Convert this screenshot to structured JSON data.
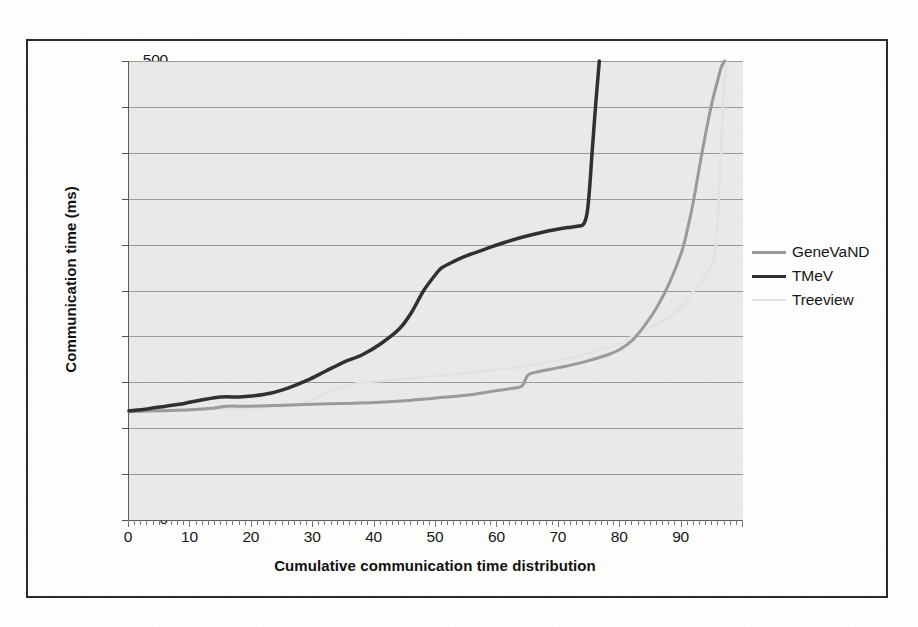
{
  "figure": {
    "background_color": "#fdfdfc",
    "frame_color": "#2b2b2b",
    "plot_background_color": "#e9e9e9",
    "gridline_color": "#9a9a9a"
  },
  "legend": {
    "position": "right",
    "entries": [
      {
        "label": "GeneVaND",
        "color": "#9a9a9a",
        "width": 3
      },
      {
        "label": "TMeV",
        "color": "#303030",
        "width": 3.5
      },
      {
        "label": "Treeview",
        "color": "#e2e2e2",
        "width": 2.5
      }
    ]
  },
  "chart_data": {
    "type": "line",
    "title": "",
    "subtitle": "",
    "xlabel": "Cumulative communication time distribution",
    "ylabel": "Communication time (ms)",
    "xlim": [
      0,
      100
    ],
    "ylim": [
      0,
      500
    ],
    "grid": true,
    "legend_position": "right",
    "xticks": [
      0,
      10,
      20,
      30,
      40,
      50,
      60,
      70,
      80,
      90
    ],
    "yticks": [
      0,
      50,
      100,
      150,
      200,
      250,
      300,
      350,
      400,
      450,
      500
    ],
    "x_minor_tick_step": 1,
    "series": [
      {
        "name": "GeneVaND",
        "color": "#9a9a9a",
        "width": 3,
        "x": [
          0,
          5,
          10,
          14,
          16,
          20,
          25,
          30,
          35,
          40,
          45,
          50,
          55,
          58,
          60,
          62,
          64,
          65,
          67,
          70,
          74,
          78,
          80,
          82,
          84,
          86,
          88,
          90,
          91,
          92,
          93,
          94,
          95,
          96,
          96.5,
          97
        ],
        "y": [
          118,
          119,
          120,
          122,
          124,
          124,
          125,
          126,
          127,
          128,
          130,
          133,
          136,
          139,
          141,
          143,
          146,
          158,
          162,
          166,
          172,
          180,
          186,
          196,
          212,
          232,
          258,
          292,
          318,
          350,
          388,
          424,
          456,
          482,
          494,
          500
        ]
      },
      {
        "name": "TMeV",
        "color": "#303030",
        "width": 3.5,
        "x": [
          0,
          3,
          6,
          9,
          12,
          15,
          18,
          20,
          23,
          26,
          29,
          32,
          35,
          38,
          41,
          44,
          46,
          48,
          50,
          51,
          53,
          55,
          58,
          61,
          64,
          67,
          70,
          72,
          73,
          74,
          74.6,
          75,
          75.4,
          76,
          76.6
        ],
        "y": [
          119,
          121,
          124,
          127,
          131,
          134,
          134,
          135,
          138,
          144,
          152,
          162,
          172,
          180,
          192,
          208,
          226,
          250,
          268,
          275,
          282,
          288,
          295,
          302,
          308,
          313,
          317,
          319,
          320,
          322,
          334,
          360,
          398,
          452,
          500
        ]
      },
      {
        "name": "Treeview",
        "color": "#e2e2e2",
        "width": 2.5,
        "x": [
          0,
          5,
          10,
          15,
          20,
          25,
          28,
          30,
          33,
          36,
          38,
          40,
          44,
          48,
          52,
          56,
          60,
          64,
          68,
          72,
          76,
          80,
          82,
          84,
          86,
          88,
          90,
          91,
          92,
          93,
          94,
          95,
          95.6,
          96,
          96.4,
          96.8,
          97.2
        ],
        "y": [
          118,
          119,
          120,
          121,
          122,
          124,
          127,
          132,
          140,
          147,
          150,
          151,
          153,
          156,
          158,
          161,
          164,
          167,
          172,
          177,
          184,
          192,
          200,
          206,
          213,
          221,
          232,
          240,
          250,
          258,
          268,
          278,
          300,
          340,
          400,
          460,
          500
        ]
      }
    ]
  }
}
